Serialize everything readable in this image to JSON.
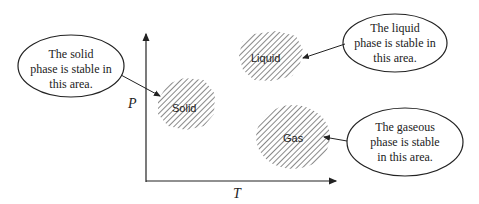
{
  "axes": {
    "y_label": "P",
    "x_label": "T"
  },
  "regions": [
    {
      "id": "solid",
      "label": "Solid"
    },
    {
      "id": "liquid",
      "label": "Liquid"
    },
    {
      "id": "gas",
      "label": "Gas"
    }
  ],
  "callouts": {
    "solid": {
      "lines": [
        "The solid",
        "phase is stable in",
        "this area."
      ]
    },
    "liquid": {
      "lines": [
        "The liquid",
        "phase is stable in",
        "this area."
      ]
    },
    "gas": {
      "lines": [
        "The gaseous",
        "phase is stable",
        "in this area."
      ]
    }
  },
  "colors": {
    "ink": "#222222",
    "hatch": "#555555",
    "background": "#ffffff"
  }
}
